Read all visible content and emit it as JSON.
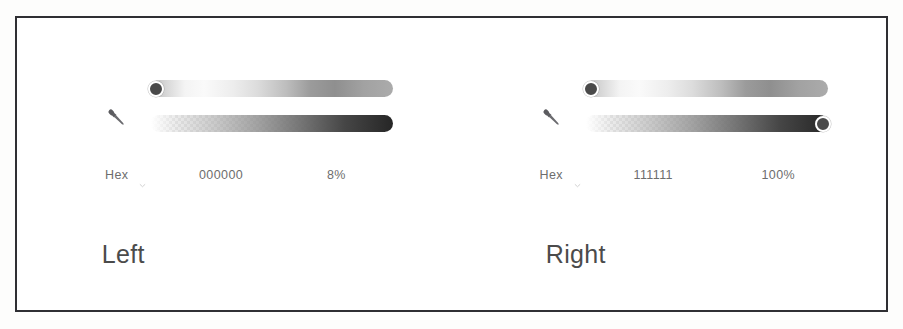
{
  "frame": {
    "border_color": "#2f2f33",
    "background": "#ffffff"
  },
  "panels": [
    {
      "id": "left",
      "caption": "Left",
      "eyedropper_icon": "eyedropper-icon",
      "mode_label": "Hex",
      "mode_chevron_icon": "chevron-down-icon",
      "hex_value": "000000",
      "opacity_value": "8%",
      "color_slider": {
        "name": "color-gradient-slider",
        "thumb_position": "start",
        "thumb_visible": true
      },
      "alpha_slider": {
        "name": "alpha-gradient-slider",
        "thumb_position": "end",
        "thumb_visible": false
      }
    },
    {
      "id": "right",
      "caption": "Right",
      "eyedropper_icon": "eyedropper-icon",
      "mode_label": "Hex",
      "mode_chevron_icon": "chevron-down-icon",
      "hex_value": "111111",
      "opacity_value": "100%",
      "color_slider": {
        "name": "color-gradient-slider",
        "thumb_position": "start",
        "thumb_visible": true
      },
      "alpha_slider": {
        "name": "alpha-gradient-slider",
        "thumb_position": "end",
        "thumb_visible": true
      }
    }
  ],
  "colors": {
    "text": "#6d6d6d",
    "caption_text": "#4b4b4b",
    "thumb_fill": "#4a4a4a",
    "thumb_ring": "#ffffff",
    "frame_stroke": "#2f2f33"
  }
}
